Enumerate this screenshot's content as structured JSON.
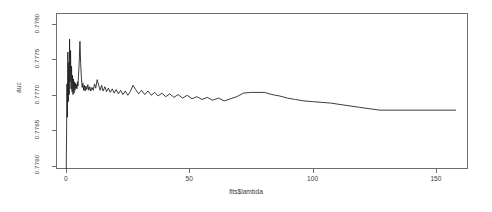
{
  "chart_data": {
    "type": "line",
    "title": "",
    "xlabel": "fits$lambda",
    "ylabel": "auc",
    "xlim": [
      -4,
      163
    ],
    "ylim": [
      0.77595,
      0.77815
    ],
    "grid": false,
    "legend": null,
    "xticks": [
      0,
      50,
      100,
      150
    ],
    "xtick_labels": [
      "0",
      "50",
      "100",
      "150"
    ],
    "yticks": [
      0.776,
      0.7765,
      0.777,
      0.7775,
      0.778
    ],
    "ytick_labels": [
      "0.7760",
      "0.7765",
      "0.7770",
      "0.7775",
      "0.7780"
    ],
    "line_color": "#1a1a1a",
    "frame_color": "#6e6e6e",
    "series": [
      {
        "name": "auc",
        "x": [
          0.15,
          0.3,
          0.45,
          0.6,
          0.8,
          1.0,
          1.2,
          1.35,
          1.5,
          1.7,
          1.9,
          2.1,
          2.3,
          2.5,
          2.7,
          2.9,
          3.1,
          3.3,
          3.5,
          3.7,
          3.9,
          4.1,
          4.3,
          4.5,
          4.7,
          4.9,
          5.1,
          5.4,
          5.7,
          6.0,
          6.3,
          6.6,
          6.9,
          7.2,
          7.5,
          7.8,
          8.1,
          8.5,
          8.9,
          9.3,
          9.7,
          10.1,
          10.6,
          11.1,
          11.6,
          12.1,
          12.7,
          13.3,
          13.9,
          14.5,
          15.1,
          15.8,
          16.5,
          17.2,
          18.0,
          18.8,
          19.6,
          20.4,
          21.3,
          22.2,
          23.1,
          24.1,
          25.1,
          26.1,
          27.2,
          28.3,
          29.5,
          30.7,
          32.0,
          33.3,
          34.6,
          36.0,
          37.4,
          38.9,
          40.5,
          42.1,
          43.8,
          45.5,
          47.3,
          49.2,
          51.1,
          53.1,
          55.2,
          57.3,
          59.5,
          61.8,
          64.2,
          66.7,
          69.3,
          72.0,
          74.8,
          77.6,
          80.5,
          83.5,
          86.6,
          89.8,
          93.1,
          96.5,
          100.0,
          103.6,
          107.3,
          111.1,
          115.0,
          119.0,
          123.1,
          127.3,
          131.6,
          136.0,
          140.5,
          145.1,
          149.8,
          154.6,
          158.0
        ],
        "y": [
          0.77595,
          0.7765,
          0.77715,
          0.77668,
          0.7776,
          0.7769,
          0.77745,
          0.777,
          0.77778,
          0.77718,
          0.77762,
          0.77708,
          0.7774,
          0.77704,
          0.77727,
          0.777,
          0.77722,
          0.77702,
          0.77718,
          0.77706,
          0.77716,
          0.77709,
          0.77714,
          0.77708,
          0.77718,
          0.77712,
          0.77725,
          0.77745,
          0.77775,
          0.77744,
          0.77723,
          0.7771,
          0.77716,
          0.77706,
          0.77713,
          0.77705,
          0.77712,
          0.77707,
          0.77714,
          0.77706,
          0.77711,
          0.77705,
          0.7771,
          0.77706,
          0.77715,
          0.77709,
          0.77721,
          0.77713,
          0.77706,
          0.77713,
          0.77705,
          0.77711,
          0.77704,
          0.77709,
          0.77703,
          0.77708,
          0.77702,
          0.77707,
          0.77701,
          0.77706,
          0.777,
          0.77705,
          0.77699,
          0.77704,
          0.77713,
          0.77707,
          0.77701,
          0.77706,
          0.777,
          0.77705,
          0.77699,
          0.77703,
          0.77698,
          0.77702,
          0.77697,
          0.77701,
          0.77696,
          0.777,
          0.77695,
          0.77699,
          0.77694,
          0.77697,
          0.77693,
          0.77696,
          0.77692,
          0.77695,
          0.77691,
          0.77694,
          0.77697,
          0.77702,
          0.77703,
          0.77703,
          0.77703,
          0.777,
          0.77698,
          0.77695,
          0.77693,
          0.77691,
          0.7769,
          0.77689,
          0.77688,
          0.77686,
          0.77684,
          0.77682,
          0.7768,
          0.77678,
          0.77678,
          0.77678,
          0.77678,
          0.77678,
          0.77678,
          0.77678,
          0.77678
        ]
      }
    ]
  }
}
